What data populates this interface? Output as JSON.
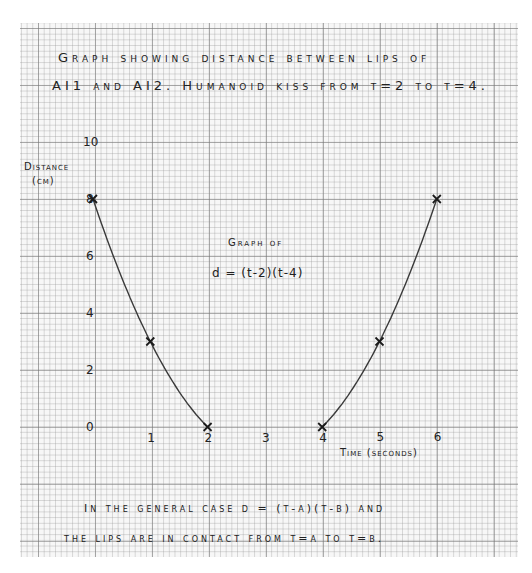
{
  "chart_data": {
    "type": "line",
    "title": [
      "Graph showing distance between lips of",
      "AI1 and AI2. Humanoid kiss from t=2 to t=4."
    ],
    "xlabel": "Time (seconds)",
    "ylabel": [
      "Distance",
      "(cm)"
    ],
    "x_ticks": [
      "0",
      "1",
      "2",
      "3",
      "4",
      "5",
      "6"
    ],
    "y_ticks": [
      "0",
      "2",
      "4",
      "6",
      "8",
      "10"
    ],
    "xlim": [
      0,
      6
    ],
    "ylim": [
      0,
      10
    ],
    "grid": true,
    "series": [
      {
        "name": "d=(t-2)(t-4), t<=2",
        "x": [
          0,
          1,
          2
        ],
        "y": [
          8,
          3,
          0
        ]
      },
      {
        "name": "d=(t-2)(t-4), t>=4",
        "x": [
          4,
          5,
          6
        ],
        "y": [
          0,
          3,
          8
        ]
      }
    ],
    "marker": "x",
    "annotation": {
      "line1": "Graph of",
      "line2": "d = (t-2)(t-4)"
    },
    "footnote": [
      "In the general case d = (t-a)(t-b) and",
      "the lips are in contact from t=a to t=b."
    ]
  }
}
